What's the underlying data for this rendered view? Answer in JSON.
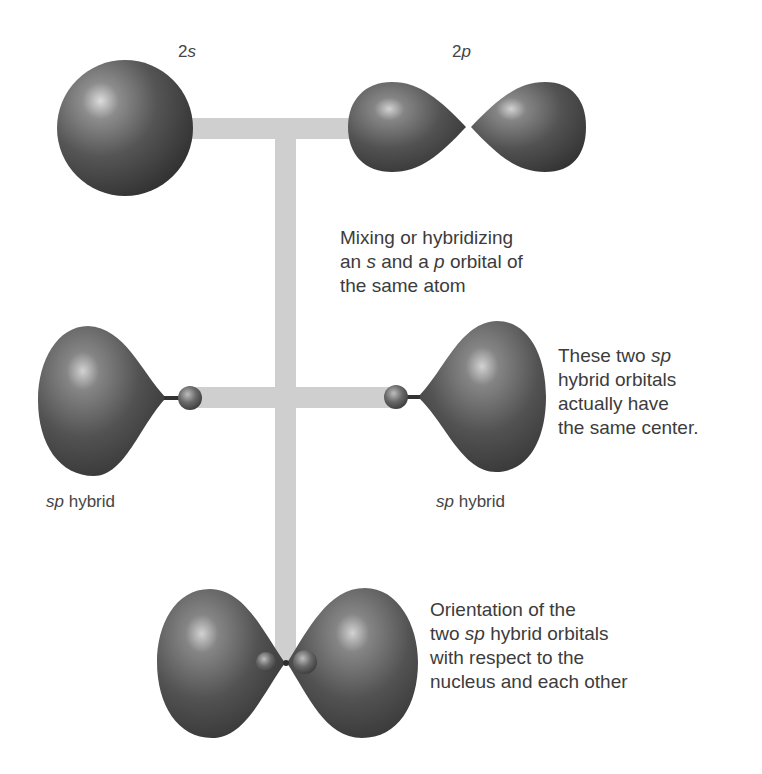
{
  "diagram": {
    "colors": {
      "connector": "#cfcfcf",
      "orbital_dark": "#3a3a3a",
      "orbital_mid": "#6a6a6a",
      "orbital_highlight": "#d8d8d8",
      "text": "#3c3c3c"
    },
    "labels": {
      "s_orbital": {
        "num": "2",
        "letter": "s"
      },
      "p_orbital": {
        "num": "2",
        "letter": "p"
      },
      "hybrid_left": {
        "italic": "sp",
        "rest": " hybrid"
      },
      "hybrid_right": {
        "italic": "sp",
        "rest": " hybrid"
      }
    },
    "annotations": {
      "mixing": {
        "line1": "Mixing or hybridizing",
        "line2_a": "an ",
        "line2_s": "s",
        "line2_b": " and a ",
        "line2_p": "p",
        "line2_c": " orbital of",
        "line3": "the same atom"
      },
      "same_center": {
        "line1_a": "These two ",
        "line1_sp": "sp",
        "line2": "hybrid orbitals",
        "line3": "actually have",
        "line4": "the same center."
      },
      "orientation": {
        "line1": "Orientation of the",
        "line2_a": "two ",
        "line2_sp": "sp",
        "line2_b": " hybrid orbitals",
        "line3": "with respect to the",
        "line4": "nucleus and each other"
      }
    },
    "nodes": [
      {
        "id": "2s",
        "shape": "sphere"
      },
      {
        "id": "2p",
        "shape": "dumbbell"
      },
      {
        "id": "sp-left",
        "shape": "hybrid-lobe"
      },
      {
        "id": "sp-right",
        "shape": "hybrid-lobe"
      },
      {
        "id": "sp-combined",
        "shape": "two-hybrid-lobes"
      }
    ]
  }
}
